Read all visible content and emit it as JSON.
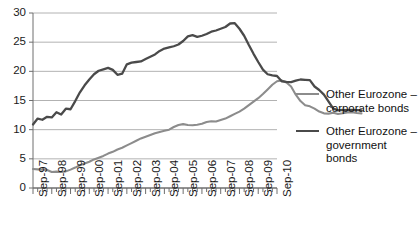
{
  "chart_data": {
    "type": "line",
    "title": "",
    "subtitle": "",
    "xlabel": "",
    "ylabel": "",
    "ylim": [
      0,
      30
    ],
    "yticks": [
      0,
      5,
      10,
      15,
      20,
      25,
      30
    ],
    "ytick_labels": [
      "0",
      "5",
      "10",
      "15",
      "20",
      "25",
      "30"
    ],
    "grid": true,
    "grid_axis": "y",
    "legend_position": "right",
    "xtick_labels": [
      "Sep-97",
      "Sep-98",
      "Sep-99",
      "Sep-00",
      "Sep-01",
      "Sep-02",
      "Sep-03",
      "Sep-04",
      "Sep-05",
      "Sep-06",
      "Sep-07",
      "Sep-08",
      "Sep-09",
      "Sep-10"
    ],
    "x_minor_per_major": 4,
    "x_start": "Sep-97",
    "x_end": "Sep-11",
    "series": [
      {
        "name": "Other Eurozone – corporate bonds",
        "color": "#8c8c8c",
        "width": 2.1,
        "values": [
          3.25,
          3.2,
          3.15,
          3.1,
          2.75,
          2.8,
          2.75,
          2.85,
          3.15,
          3.5,
          3.9,
          4.2,
          4.5,
          4.9,
          5.2,
          5.5,
          5.9,
          6.2,
          6.6,
          6.9,
          7.3,
          7.7,
          8.1,
          8.5,
          8.8,
          9.1,
          9.4,
          9.6,
          9.8,
          10.0,
          10.45,
          10.8,
          10.95,
          10.8,
          10.75,
          10.85,
          11.0,
          11.3,
          11.45,
          11.4,
          11.65,
          11.9,
          12.3,
          12.7,
          13.1,
          13.6,
          14.2,
          14.8,
          15.4,
          16.1,
          16.9,
          17.7,
          18.3,
          18.45,
          18.1,
          17.4,
          16.0,
          14.9,
          14.2,
          14.0,
          13.6,
          13.1,
          12.8,
          12.75,
          12.9,
          12.7,
          12.8,
          12.95,
          13.0,
          12.85,
          12.8
        ]
      },
      {
        "name": "Other Eurozone – government bonds",
        "color": "#4a4a4a",
        "width": 2.3,
        "values": [
          10.9,
          11.9,
          11.7,
          12.2,
          12.1,
          13.0,
          12.6,
          13.6,
          13.5,
          14.9,
          16.4,
          17.6,
          18.6,
          19.5,
          20.1,
          20.35,
          20.6,
          20.25,
          19.4,
          19.6,
          21.2,
          21.5,
          21.6,
          21.7,
          22.1,
          22.5,
          22.9,
          23.5,
          23.9,
          24.1,
          24.3,
          24.6,
          25.2,
          26.0,
          26.2,
          25.9,
          26.1,
          26.4,
          26.8,
          27.0,
          27.3,
          27.6,
          28.2,
          28.25,
          27.3,
          26.1,
          24.5,
          23.0,
          21.6,
          20.3,
          19.5,
          19.3,
          19.2,
          18.3,
          18.2,
          18.15,
          18.4,
          18.6,
          18.55,
          18.5,
          17.4,
          16.8,
          16.0,
          14.8,
          13.6,
          13.3,
          13.4,
          13.35,
          13.4,
          13.35,
          13.3
        ]
      }
    ]
  }
}
